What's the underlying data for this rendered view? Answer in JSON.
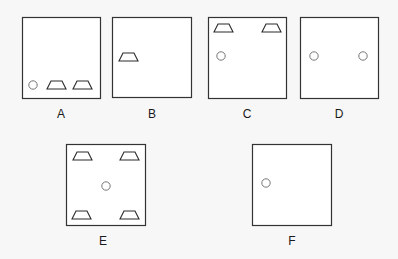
{
  "colors": {
    "background": "#f7f7f7",
    "box_fill": "#ffffff",
    "box_stroke": "#333333",
    "shape_stroke": "#2a2a2a",
    "circle_stroke": "#777777"
  },
  "panels": [
    {
      "label": "A",
      "box": {
        "x": 22,
        "y": 17,
        "w": 78,
        "h": 81
      },
      "label_pos": {
        "x": 61,
        "y": 108
      },
      "circles": [
        {
          "cx": 33,
          "cy": 85
        }
      ],
      "trapezoids": [
        {
          "x": 47,
          "y": 81
        },
        {
          "x": 73,
          "y": 81
        }
      ]
    },
    {
      "label": "B",
      "box": {
        "x": 112,
        "y": 17,
        "w": 79,
        "h": 80
      },
      "label_pos": {
        "x": 152,
        "y": 108
      },
      "circles": [],
      "trapezoids": [
        {
          "x": 119,
          "y": 53
        }
      ]
    },
    {
      "label": "C",
      "box": {
        "x": 208,
        "y": 17,
        "w": 78,
        "h": 81
      },
      "label_pos": {
        "x": 247,
        "y": 108
      },
      "circles": [
        {
          "cx": 221,
          "cy": 56
        }
      ],
      "trapezoids": [
        {
          "x": 214,
          "y": 24
        },
        {
          "x": 262,
          "y": 24
        }
      ]
    },
    {
      "label": "D",
      "box": {
        "x": 300,
        "y": 17,
        "w": 78,
        "h": 81
      },
      "label_pos": {
        "x": 339,
        "y": 108
      },
      "circles": [
        {
          "cx": 314,
          "cy": 56
        },
        {
          "cx": 363,
          "cy": 56
        }
      ],
      "trapezoids": []
    },
    {
      "label": "E",
      "box": {
        "x": 66,
        "y": 144,
        "w": 79,
        "h": 81
      },
      "label_pos": {
        "x": 103,
        "y": 235
      },
      "circles": [
        {
          "cx": 106,
          "cy": 186
        }
      ],
      "trapezoids": [
        {
          "x": 73,
          "y": 152
        },
        {
          "x": 120,
          "y": 152
        },
        {
          "x": 72,
          "y": 211
        },
        {
          "x": 120,
          "y": 211
        }
      ]
    },
    {
      "label": "F",
      "box": {
        "x": 252,
        "y": 144,
        "w": 79,
        "h": 81
      },
      "label_pos": {
        "x": 292,
        "y": 235
      },
      "circles": [
        {
          "cx": 266,
          "cy": 183
        }
      ],
      "trapezoids": []
    }
  ]
}
